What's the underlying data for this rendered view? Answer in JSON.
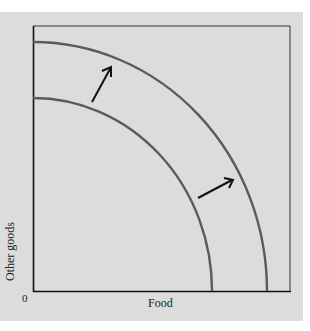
{
  "diagram": {
    "type": "production possibilities frontier shift",
    "x_axis_label": "Food",
    "y_axis_label": "Other goods",
    "origin_label": "0",
    "curves": [
      {
        "name": "original-ppf",
        "y_intercept_px": 98,
        "x_intercept_px": 212
      },
      {
        "name": "shifted-ppf",
        "y_intercept_px": 42,
        "x_intercept_px": 267
      }
    ],
    "arrows": [
      {
        "name": "upper-shift-arrow",
        "direction": "outward"
      },
      {
        "name": "lower-shift-arrow",
        "direction": "outward"
      }
    ],
    "colors": {
      "background": "#dcdcdc",
      "curve": "#5a5a5a",
      "axis": "#111111",
      "arrow": "#111111"
    }
  }
}
